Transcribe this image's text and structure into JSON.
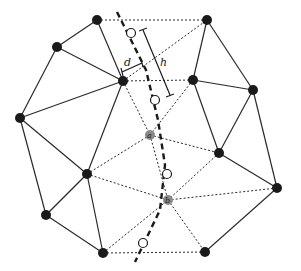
{
  "diagram": {
    "type": "triangulated mesh with dashed path",
    "colors": {
      "edge": "#2a2a2a",
      "node": "#1a1a1a",
      "special_node": "#8a8a8a",
      "background": "#ffffff"
    },
    "labels": {
      "d": "d",
      "h": "h",
      "a": "a",
      "b": "b"
    },
    "nodes": [
      {
        "id": "n1",
        "x": 97,
        "y": 20
      },
      {
        "id": "n2",
        "x": 207,
        "y": 20
      },
      {
        "id": "n3",
        "x": 57,
        "y": 47
      },
      {
        "id": "n4",
        "x": 123,
        "y": 81
      },
      {
        "id": "n5",
        "x": 193,
        "y": 80
      },
      {
        "id": "n6",
        "x": 253,
        "y": 90
      },
      {
        "id": "n7",
        "x": 20,
        "y": 118
      },
      {
        "id": "n8",
        "x": 87,
        "y": 174
      },
      {
        "id": "n9",
        "x": 219,
        "y": 153
      },
      {
        "id": "n10",
        "x": 277,
        "y": 188
      },
      {
        "id": "n11",
        "x": 46,
        "y": 215
      },
      {
        "id": "n12",
        "x": 103,
        "y": 253
      },
      {
        "id": "n13",
        "x": 205,
        "y": 252
      }
    ],
    "special_nodes": [
      {
        "id": "a",
        "x": 150,
        "y": 135
      },
      {
        "id": "b",
        "x": 168,
        "y": 200
      }
    ],
    "hollow_points": [
      {
        "x": 131,
        "y": 33
      },
      {
        "x": 155,
        "y": 100
      },
      {
        "x": 167,
        "y": 174
      },
      {
        "x": 143,
        "y": 243
      }
    ]
  }
}
